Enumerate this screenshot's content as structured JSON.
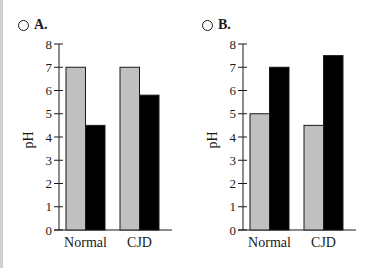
{
  "options": [
    {
      "label": "A.",
      "selected": false
    },
    {
      "label": "B.",
      "selected": false
    }
  ],
  "chart_data": [
    {
      "type": "bar",
      "title": "A.",
      "categories": [
        "Normal",
        "CJD"
      ],
      "series": [
        {
          "name": "gray",
          "color": "#c0c0c0",
          "values": [
            7.0,
            7.0
          ]
        },
        {
          "name": "black",
          "color": "#000000",
          "values": [
            4.5,
            5.8
          ]
        }
      ],
      "xlabel": "",
      "ylabel": "pH",
      "ylim": [
        0,
        8
      ],
      "yticks": [
        0,
        1,
        2,
        3,
        4,
        5,
        6,
        7,
        8
      ],
      "grid": false,
      "legend": "none"
    },
    {
      "type": "bar",
      "title": "B.",
      "categories": [
        "Normal",
        "CJD"
      ],
      "series": [
        {
          "name": "gray",
          "color": "#c0c0c0",
          "values": [
            5.0,
            4.5
          ]
        },
        {
          "name": "black",
          "color": "#000000",
          "values": [
            7.0,
            7.5
          ]
        }
      ],
      "xlabel": "",
      "ylabel": "pH",
      "ylim": [
        0,
        8
      ],
      "yticks": [
        0,
        1,
        2,
        3,
        4,
        5,
        6,
        7,
        8
      ],
      "grid": false,
      "legend": "none"
    }
  ]
}
